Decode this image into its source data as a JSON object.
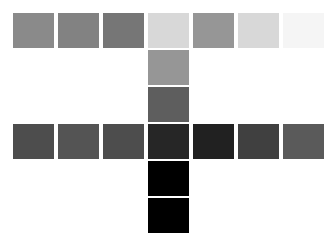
{
  "board": {
    "title": "Grayscale Swatch Cross",
    "background_color": "#ffffff",
    "width": 336,
    "height": 239,
    "columns": 7,
    "rows": 5,
    "cell_width": 43,
    "cell_height": 37,
    "col_step": 45,
    "row_step": 37,
    "origin_x": 12,
    "origin_y": 12,
    "shape": "plus-cross"
  },
  "chart_data": {
    "type": "heatmap",
    "xlabel": "",
    "ylabel": "",
    "grid": false,
    "legend": "none",
    "columns": [
      "c1",
      "c2",
      "c3",
      "c4",
      "c5",
      "c6",
      "c7"
    ],
    "rows": [
      "r1",
      "r2",
      "r3",
      "r4",
      "r5"
    ],
    "value_unit": "gray-level-0-255",
    "null_cells_blank": true,
    "values": [
      [
        138,
        130,
        118,
        216,
        150,
        216,
        245
      ],
      [
        null,
        null,
        null,
        150,
        null,
        null,
        null
      ],
      [
        null,
        null,
        null,
        94,
        null,
        null,
        null
      ],
      [
        77,
        84,
        77,
        38,
        33,
        64,
        90
      ],
      [
        null,
        null,
        null,
        0,
        null,
        null,
        null
      ],
      [
        null,
        null,
        null,
        0,
        null,
        null,
        null
      ]
    ]
  },
  "swatches": [
    {
      "name": "swatch-r1c1",
      "row": 1,
      "col": 1,
      "x": 12,
      "y": 12,
      "w": 43,
      "h": 37,
      "color": "#8a8a8a",
      "gray": 138
    },
    {
      "name": "swatch-r1c2",
      "row": 1,
      "col": 2,
      "x": 57,
      "y": 12,
      "w": 43,
      "h": 37,
      "color": "#828282",
      "gray": 130
    },
    {
      "name": "swatch-r1c3",
      "row": 1,
      "col": 3,
      "x": 102,
      "y": 12,
      "w": 43,
      "h": 37,
      "color": "#767676",
      "gray": 118
    },
    {
      "name": "swatch-r1c4",
      "row": 1,
      "col": 4,
      "x": 147,
      "y": 12,
      "w": 43,
      "h": 37,
      "color": "#d8d8d8",
      "gray": 216
    },
    {
      "name": "swatch-r1c5",
      "row": 1,
      "col": 5,
      "x": 192,
      "y": 12,
      "w": 43,
      "h": 37,
      "color": "#969696",
      "gray": 150
    },
    {
      "name": "swatch-r1c6",
      "row": 1,
      "col": 6,
      "x": 237,
      "y": 12,
      "w": 43,
      "h": 37,
      "color": "#d8d8d8",
      "gray": 216
    },
    {
      "name": "swatch-r1c7",
      "row": 1,
      "col": 7,
      "x": 282,
      "y": 12,
      "w": 43,
      "h": 37,
      "color": "#f5f5f5",
      "gray": 245
    },
    {
      "name": "swatch-r2c4",
      "row": 2,
      "col": 4,
      "x": 147,
      "y": 49,
      "w": 43,
      "h": 37,
      "color": "#969696",
      "gray": 150
    },
    {
      "name": "swatch-r3c4",
      "row": 3,
      "col": 4,
      "x": 147,
      "y": 86,
      "w": 43,
      "h": 37,
      "color": "#5e5e5e",
      "gray": 94
    },
    {
      "name": "swatch-r4c1",
      "row": 4,
      "col": 1,
      "x": 12,
      "y": 123,
      "w": 43,
      "h": 37,
      "color": "#4d4d4d",
      "gray": 77
    },
    {
      "name": "swatch-r4c2",
      "row": 4,
      "col": 2,
      "x": 57,
      "y": 123,
      "w": 43,
      "h": 37,
      "color": "#545454",
      "gray": 84
    },
    {
      "name": "swatch-r4c3",
      "row": 4,
      "col": 3,
      "x": 102,
      "y": 123,
      "w": 43,
      "h": 37,
      "color": "#4d4d4d",
      "gray": 77
    },
    {
      "name": "swatch-r4c4",
      "row": 4,
      "col": 4,
      "x": 147,
      "y": 123,
      "w": 43,
      "h": 37,
      "color": "#262626",
      "gray": 38
    },
    {
      "name": "swatch-r4c5",
      "row": 4,
      "col": 5,
      "x": 192,
      "y": 123,
      "w": 43,
      "h": 37,
      "color": "#212121",
      "gray": 33
    },
    {
      "name": "swatch-r4c6",
      "row": 4,
      "col": 6,
      "x": 237,
      "y": 123,
      "w": 43,
      "h": 37,
      "color": "#404040",
      "gray": 64
    },
    {
      "name": "swatch-r4c7",
      "row": 4,
      "col": 7,
      "x": 282,
      "y": 123,
      "w": 43,
      "h": 37,
      "color": "#5a5a5a",
      "gray": 90
    },
    {
      "name": "swatch-r5c4",
      "row": 5,
      "col": 4,
      "x": 147,
      "y": 160,
      "w": 43,
      "h": 37,
      "color": "#000000",
      "gray": 0
    },
    {
      "name": "swatch-r6c4",
      "row": 6,
      "col": 4,
      "x": 147,
      "y": 197,
      "w": 43,
      "h": 37,
      "color": "#000000",
      "gray": 0
    }
  ]
}
